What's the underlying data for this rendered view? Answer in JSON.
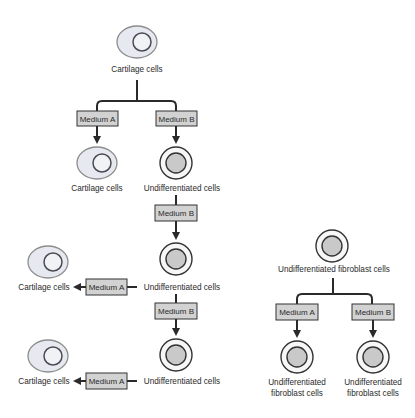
{
  "colors": {
    "medium_box_fill": "#d2d2d2",
    "cartilage_fill": "#e6eaf0",
    "undiff_nucleus_fill": "#c9c9c9",
    "line": "#2a2a2a"
  },
  "left_flow": {
    "top_cell": {
      "label": "Cartilage cells",
      "type": "cartilage"
    },
    "branch": {
      "medium_a": "Medium A",
      "medium_b": "Medium B"
    },
    "row2": {
      "left_cell": {
        "label": "Cartilage cells",
        "type": "cartilage"
      },
      "right_cell": {
        "label": "Undifferentiated cells",
        "type": "undifferentiated"
      }
    },
    "step2_medium": "Medium B",
    "row3": {
      "left_cell": {
        "label": "Cartilage cells",
        "type": "cartilage"
      },
      "side_medium": "Medium A",
      "right_cell": {
        "label": "Undifferentiated cells",
        "type": "undifferentiated"
      }
    },
    "step3_medium": "Medium B",
    "row4": {
      "left_cell": {
        "label": "Cartilage cells",
        "type": "cartilage"
      },
      "side_medium": "Medium A",
      "right_cell": {
        "label": "Undifferentiated cells",
        "type": "undifferentiated"
      }
    }
  },
  "right_flow": {
    "top_cell": {
      "label": "Undifferentiated fibroblast cells",
      "type": "undifferentiated"
    },
    "branch": {
      "medium_a": "Medium A",
      "medium_b": "Medium B"
    },
    "left_result": {
      "label_line1": "Undifferentiated",
      "label_line2": "fibroblast cells"
    },
    "right_result": {
      "label_line1": "Undifferentiated",
      "label_line2": "fibroblast cells"
    }
  }
}
